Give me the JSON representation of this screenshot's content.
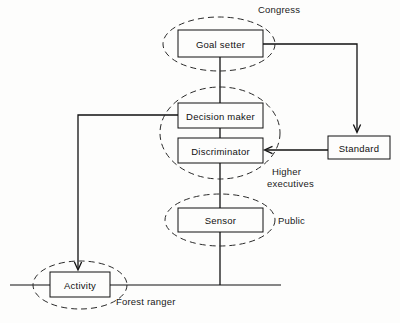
{
  "diagram": {
    "background_color": "#fdfdfc",
    "line_color": "#111111",
    "nodes": [
      {
        "id": "goal-setter",
        "label": "Goal setter"
      },
      {
        "id": "decision-maker",
        "label": "Decision maker"
      },
      {
        "id": "discriminator",
        "label": "Discriminator"
      },
      {
        "id": "sensor",
        "label": "Sensor"
      },
      {
        "id": "activity",
        "label": "Activity"
      },
      {
        "id": "standard",
        "label": "Standard"
      }
    ],
    "group_labels": [
      {
        "id": "congress",
        "label": "Congress"
      },
      {
        "id": "higher-executives",
        "label_line1": "Higher",
        "label_line2": "executives"
      },
      {
        "id": "public",
        "label": "Public"
      },
      {
        "id": "forest-ranger",
        "label": "Forest ranger"
      }
    ]
  }
}
